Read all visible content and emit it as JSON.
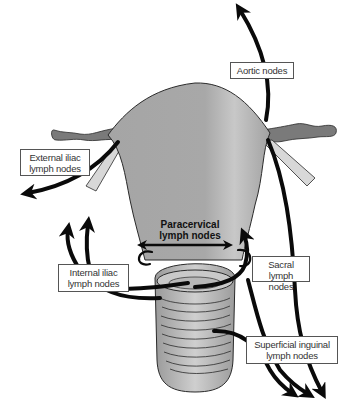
{
  "figure": {
    "colors": {
      "uterus_fill": "#a9a9a9",
      "uterus_highlight": "#c4c4c4",
      "outline": "#2a2a2a",
      "arrow": "#0a0a0a",
      "ligament_fill": "#d8d8d8",
      "tube_fill": "#7a7a7a",
      "label_border": "#555555",
      "background": "#ffffff"
    }
  },
  "labels": {
    "aortic": {
      "line1": "Aortic nodes"
    },
    "external_iliac": {
      "line1": "External iliac",
      "line2": "lymph nodes"
    },
    "paracervical": {
      "line1": "Paracervical",
      "line2": "lymph nodes"
    },
    "internal_iliac": {
      "line1": "Internal iliac",
      "line2": "lymph nodes"
    },
    "sacral": {
      "line1": "Sacral lymph",
      "line2": "nodes"
    },
    "superficial_inguinal": {
      "line1": "Superficial inguinal",
      "line2": "lymph nodes"
    }
  }
}
